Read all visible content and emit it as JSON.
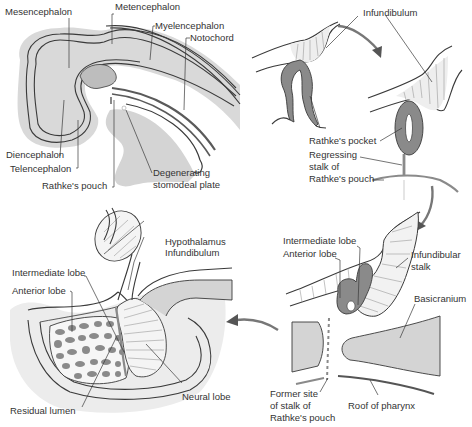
{
  "figure": {
    "colors": {
      "background": "#ffffff",
      "light_gray_fill": "#d4d4d4",
      "dark_gray_fill": "#8a8a8a",
      "outline": "#3a3a3a",
      "label_text": "#333333",
      "arrow": "#555555"
    },
    "panels": [
      {
        "id": "panel-a",
        "position": "top-left",
        "description": "Sagittal section of embryonic head",
        "labels": [
          "Mesencephalon",
          "Metencephalon",
          "Myelencephalon",
          "Notochord",
          "Diencephalon",
          "Telencephalon",
          "Rathke's pouch",
          "Degenerating",
          "stomodeal plate"
        ]
      },
      {
        "id": "panel-b",
        "position": "top-right",
        "description": "Rathke's pocket forming and separating",
        "labels": [
          "Infundibulum",
          "Rathke's pocket",
          "Regressing",
          "stalk of",
          "Rathke's pouch"
        ]
      },
      {
        "id": "panel-c",
        "position": "bottom-right",
        "description": "Separated pituitary above basicranium",
        "labels": [
          "Intermediate lobe",
          "Anterior lobe",
          "Infundibular",
          "stalk",
          "Basicranium",
          "Former site",
          "of stalk of",
          "Rathke's pouch",
          "Roof of pharynx"
        ]
      },
      {
        "id": "panel-d",
        "position": "bottom-left",
        "description": "Mature pituitary gland in sella turcica",
        "labels": [
          "Hypothalamus",
          "Infundibulum",
          "Intermediate lobe",
          "Anterior lobe",
          "Neural lobe",
          "Residual lumen"
        ]
      }
    ],
    "arrows": [
      {
        "from": "panel-b-left",
        "to": "panel-b-right",
        "direction": "clockwise-down"
      },
      {
        "from": "panel-b",
        "to": "panel-c",
        "direction": "down"
      },
      {
        "from": "panel-c",
        "to": "panel-d",
        "direction": "left"
      }
    ]
  }
}
